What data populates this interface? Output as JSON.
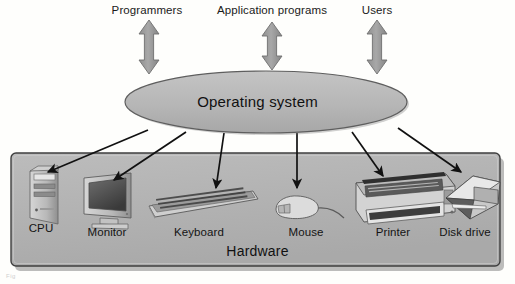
{
  "diagram": {
    "top_labels": [
      {
        "name": "programmers",
        "text": "Programmers",
        "cx": 147,
        "width": 110
      },
      {
        "name": "application-programs",
        "text": "Application programs",
        "cx": 272,
        "width": 160
      },
      {
        "name": "users",
        "text": "Users",
        "cx": 377,
        "width": 80
      }
    ],
    "top_arrows": [
      {
        "name": "programmers-arrow",
        "cx": 149,
        "top": 20,
        "bottom": 74,
        "double": true
      },
      {
        "name": "application-programs-arrow",
        "cx": 272,
        "top": 22,
        "bottom": 70,
        "double": true
      },
      {
        "name": "users-arrow",
        "cx": 377,
        "top": 20,
        "bottom": 74,
        "double": true
      }
    ],
    "os_ellipse": {
      "name": "operating-system-ellipse",
      "label": "Operating system",
      "cx": 266,
      "cy": 102,
      "rx": 141,
      "ry": 31
    },
    "hardware_box": {
      "name": "hardware-box",
      "label": "Hardware",
      "x": 11,
      "y": 153,
      "width": 489,
      "height": 113
    },
    "devices": [
      {
        "name": "cpu",
        "label": "CPU",
        "label_cx": 41,
        "label_y": 227,
        "arrow_from_x": 148,
        "arrow_from_y": 130,
        "arrow_to_x": 46,
        "arrow_to_y": 172
      },
      {
        "name": "monitor",
        "label": "Monitor",
        "label_cx": 107,
        "label_y": 230,
        "arrow_from_x": 186,
        "arrow_from_y": 132,
        "arrow_to_x": 112,
        "arrow_to_y": 180
      },
      {
        "name": "keyboard",
        "label": "Keyboard",
        "label_cx": 198,
        "label_y": 231,
        "arrow_from_x": 223,
        "arrow_from_y": 133,
        "arrow_to_x": 216,
        "arrow_to_y": 188
      },
      {
        "name": "mouse",
        "label": "Mouse",
        "label_cx": 305,
        "label_y": 231,
        "arrow_from_x": 297,
        "arrow_from_y": 133,
        "arrow_to_x": 297,
        "arrow_to_y": 188
      },
      {
        "name": "printer",
        "label": "Printer",
        "label_cx": 392,
        "label_y": 231,
        "arrow_from_x": 353,
        "arrow_from_y": 132,
        "arrow_to_x": 384,
        "arrow_to_y": 175
      },
      {
        "name": "disk-drive",
        "label": "Disk drive",
        "label_cx": 464,
        "label_y": 231,
        "arrow_from_x": 398,
        "arrow_from_y": 128,
        "arrow_to_x": 463,
        "arrow_to_y": 173
      }
    ],
    "colors": {
      "arrow_gray": "#9a9a9a",
      "arrow_gray_stroke": "#6f6f6f",
      "ellipse_fill": "#b9b9b9",
      "ellipse_stroke": "#6a6a6a",
      "box_fill": "#b5b5b5",
      "box_stroke": "#4a4a4a",
      "device_dark": "#4a4a4a",
      "device_light": "#e2e2e2",
      "connector_black": "#111111",
      "page_background": "#fefefc"
    },
    "caption_fragment": "Fig"
  }
}
